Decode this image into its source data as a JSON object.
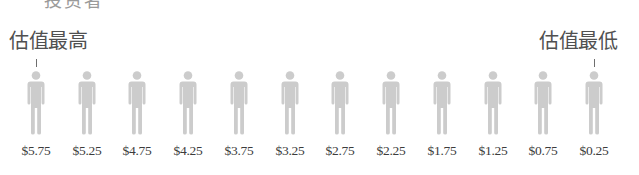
{
  "header_fragment": "投资者",
  "labels": {
    "highest": "估值最高",
    "lowest": "估值最低"
  },
  "figure_color": "#cccccc",
  "investors": [
    {
      "price": "$5.75"
    },
    {
      "price": "$5.25"
    },
    {
      "price": "$4.75"
    },
    {
      "price": "$4.25"
    },
    {
      "price": "$3.75"
    },
    {
      "price": "$3.25"
    },
    {
      "price": "$2.75"
    },
    {
      "price": "$2.25"
    },
    {
      "price": "$1.75"
    },
    {
      "price": "$1.25"
    },
    {
      "price": "$0.75"
    },
    {
      "price": "$0.25"
    }
  ],
  "chart_data": {
    "type": "pictogram",
    "title": "",
    "annotations": [
      {
        "text": "估值最高",
        "points_to_index": 0
      },
      {
        "text": "估值最低",
        "points_to_index": 11
      }
    ],
    "categories": [
      "$5.75",
      "$5.25",
      "$4.75",
      "$4.25",
      "$3.75",
      "$3.25",
      "$2.75",
      "$2.25",
      "$1.75",
      "$1.25",
      "$0.75",
      "$0.25"
    ],
    "values": [
      5.75,
      5.25,
      4.75,
      4.25,
      3.75,
      3.25,
      2.75,
      2.25,
      1.75,
      1.25,
      0.75,
      0.25
    ],
    "xlabel": "",
    "ylabel": ""
  }
}
